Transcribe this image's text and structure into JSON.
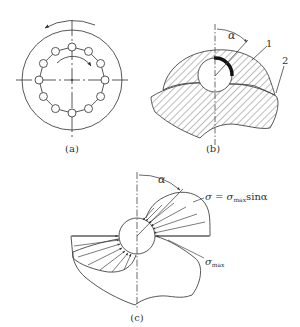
{
  "figure": {
    "panels": [
      {
        "id": "a",
        "caption": "(a)"
      },
      {
        "id": "b",
        "caption": "(b)",
        "labels": {
          "angle": "α",
          "part1": "1",
          "part2": "2"
        }
      },
      {
        "id": "c",
        "caption": "(c)",
        "labels": {
          "angle": "α",
          "formula_sigma": "σ = σ",
          "formula_sub": "max",
          "formula_tail": "sinα",
          "sigma_max": "σ",
          "sigma_max_sub": "max"
        }
      }
    ]
  },
  "colors": {
    "line": "#444444",
    "background": "#ffffff"
  }
}
